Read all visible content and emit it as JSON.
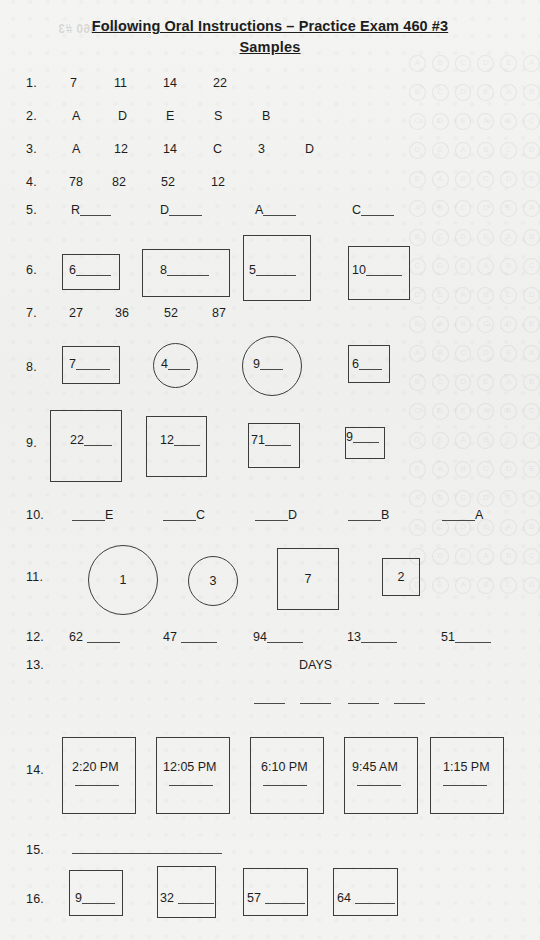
{
  "document": {
    "title_line_1": "Following Oral Instructions – Practice Exam 460 #3",
    "title_line_2": "Samples",
    "ghost_bleed_text": "Exam 460 #3"
  },
  "rows": [
    {
      "number": "1.",
      "kind": "plain",
      "items": [
        "7",
        "11",
        "14",
        "22"
      ]
    },
    {
      "number": "2.",
      "kind": "plain",
      "items": [
        "A",
        "D",
        "E",
        "S",
        "B"
      ]
    },
    {
      "number": "3.",
      "kind": "plain",
      "items": [
        "A",
        "12",
        "14",
        "C",
        "3",
        "D"
      ]
    },
    {
      "number": "4.",
      "kind": "plain",
      "items": [
        "78",
        "82",
        "52",
        "12"
      ]
    },
    {
      "number": "5.",
      "kind": "prefix-blank",
      "items": [
        "R",
        "D",
        "A",
        "C"
      ]
    },
    {
      "number": "6.",
      "kind": "boxes",
      "items": [
        "6",
        "8",
        "5",
        "10"
      ]
    },
    {
      "number": "7.",
      "kind": "plain",
      "items": [
        "27",
        "36",
        "52",
        "87"
      ]
    },
    {
      "number": "8.",
      "kind": "mixed",
      "items": [
        "7",
        "4",
        "9",
        "6"
      ]
    },
    {
      "number": "9.",
      "kind": "boxes",
      "items": [
        "22",
        "12",
        "71",
        "9"
      ]
    },
    {
      "number": "10.",
      "kind": "suffix-blank",
      "items": [
        "E",
        "C",
        "D",
        "B",
        "A"
      ]
    },
    {
      "number": "11.",
      "kind": "mixed-centered",
      "items": [
        "1",
        "3",
        "7",
        "2"
      ]
    },
    {
      "number": "12.",
      "kind": "prefix-blank",
      "items": [
        "62",
        "47",
        "94",
        "13",
        "51"
      ]
    },
    {
      "number": "13.",
      "kind": "days",
      "label": "DAYS",
      "dash_count": 4
    },
    {
      "number": "14.",
      "kind": "time-boxes",
      "items": [
        "2:20 PM",
        "12:05 PM",
        "6:10 PM",
        "9:45 AM",
        "1:15 PM"
      ]
    },
    {
      "number": "15.",
      "kind": "long-blank"
    },
    {
      "number": "16.",
      "kind": "boxes",
      "items": [
        "9",
        "32",
        "57",
        "64"
      ]
    }
  ],
  "colors": {
    "paper": "#f2f2f0",
    "ink": "#1d1d1d",
    "rule": "#3c3c3c"
  }
}
